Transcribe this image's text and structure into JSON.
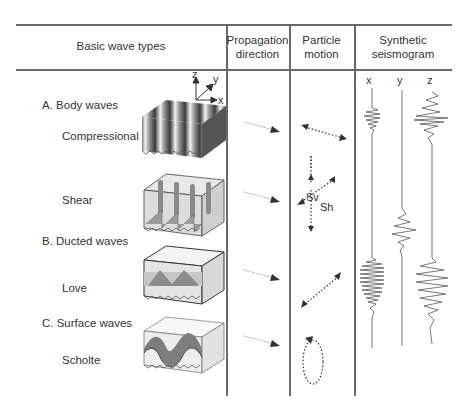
{
  "table": {
    "headers": [
      {
        "label": "Basic wave types"
      },
      {
        "line1": "Propagation",
        "line2": "direction"
      },
      {
        "line1": "Particle",
        "line2": "motion"
      },
      {
        "line1": "Synthetic",
        "line2": "seismogram"
      }
    ],
    "axes": {
      "z": "z",
      "y": "y",
      "x": "x"
    },
    "seismogram_components": [
      "x",
      "y",
      "z"
    ],
    "groups": [
      {
        "title": "A. Body waves",
        "rows": [
          {
            "name": "Compressional",
            "particle_motion": "linear, parallel to propagation"
          },
          {
            "name": "Shear",
            "particle_motion": "transverse",
            "labels": {
              "sv": "Sv",
              "sh": "Sh"
            }
          }
        ]
      },
      {
        "title": "B. Ducted waves",
        "rows": [
          {
            "name": "Love",
            "particle_motion": "linear, horizontal transverse"
          }
        ]
      },
      {
        "title": "C. Surface waves",
        "rows": [
          {
            "name": "Scholte",
            "particle_motion": "elliptical"
          }
        ]
      }
    ]
  },
  "colors": {
    "line": "#6a6a6a",
    "text": "#333333",
    "ink": "#444444"
  }
}
